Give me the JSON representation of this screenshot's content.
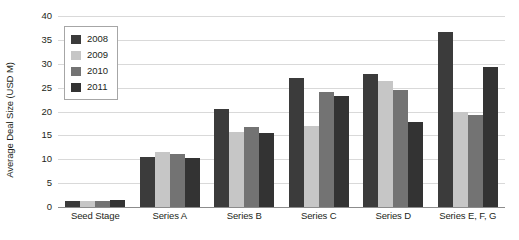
{
  "chart_data": {
    "type": "bar",
    "title": "",
    "xlabel": "",
    "ylabel": "Average Deal Size (USD M)",
    "ylim": [
      0,
      40
    ],
    "ytick_step": 5,
    "yticks": [
      40,
      35,
      30,
      25,
      20,
      15,
      10,
      5,
      0
    ],
    "grid": true,
    "legend_position": "upper-left-inside",
    "categories": [
      "Seed Stage",
      "Series A",
      "Series B",
      "Series C",
      "Series D",
      "Series E, F, G"
    ],
    "series": [
      {
        "name": "2008",
        "color": "#3b3b3b",
        "values": [
          1.2,
          10.4,
          20.6,
          27.0,
          27.9,
          36.7
        ]
      },
      {
        "name": "2009",
        "color": "#c6c6c6",
        "values": [
          1.3,
          11.5,
          15.7,
          16.9,
          26.4,
          20.0
        ]
      },
      {
        "name": "2010",
        "color": "#737373",
        "values": [
          1.2,
          11.1,
          16.7,
          24.0,
          24.6,
          19.2
        ]
      },
      {
        "name": "2011",
        "color": "#333333",
        "values": [
          1.5,
          10.3,
          15.4,
          23.2,
          17.9,
          29.3
        ]
      }
    ]
  },
  "colors": {
    "gridline": "#d9d9d9",
    "axis": "#8c8c8c",
    "text": "#231f20",
    "background": "#ffffff",
    "legend_border": "#a6a6a6"
  }
}
